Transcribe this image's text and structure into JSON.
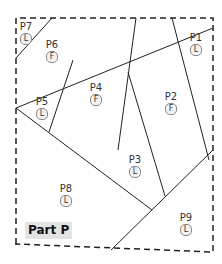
{
  "part_label": "Part P",
  "pieces": [
    {
      "id": "P1",
      "badge": "L"
    },
    {
      "id": "P2",
      "badge": "F"
    },
    {
      "id": "P3",
      "badge": "L"
    },
    {
      "id": "P4",
      "badge": "F"
    },
    {
      "id": "P5",
      "badge": "L"
    },
    {
      "id": "P6",
      "badge": "F"
    },
    {
      "id": "P7",
      "badge": "L"
    },
    {
      "id": "P8",
      "badge": "L"
    },
    {
      "id": "P9",
      "badge": "L"
    }
  ],
  "colors": {
    "line": "#222222",
    "border": "#222222",
    "badge_bg": "#f2f2f2",
    "part_label_bg": "#e3e3e3"
  }
}
